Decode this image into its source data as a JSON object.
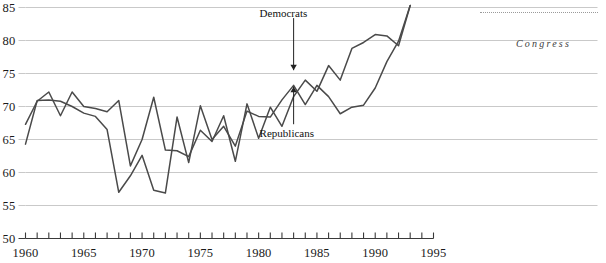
{
  "figure": {
    "margin_note": "Congress",
    "dotted_rule": "decorative-dotted-rule"
  },
  "chart_data": {
    "type": "line",
    "title": "",
    "subtitle": "",
    "xlabel": "",
    "ylabel": "",
    "grid": true,
    "legend_position": "inline-annotations",
    "xlim": [
      1960,
      1995
    ],
    "ylim": [
      50,
      85
    ],
    "y_ticks": [
      50,
      55,
      60,
      65,
      70,
      75,
      80,
      85
    ],
    "y_tick_labels": [
      "50",
      "55",
      "60",
      "65",
      "70",
      "75",
      "80",
      "85"
    ],
    "x_ticks": [
      1960,
      1961,
      1962,
      1963,
      1964,
      1965,
      1966,
      1967,
      1968,
      1969,
      1970,
      1971,
      1972,
      1973,
      1974,
      1975,
      1976,
      1977,
      1978,
      1979,
      1980,
      1981,
      1982,
      1983,
      1984,
      1985,
      1986,
      1987,
      1988,
      1989,
      1990,
      1991,
      1992,
      1993,
      1994,
      1995
    ],
    "x_tick_labels_shown": [
      "1960",
      "1965",
      "1970",
      "1975",
      "1980",
      "1985",
      "1990",
      "1995"
    ],
    "x_labeled_ticks": [
      1960,
      1965,
      1970,
      1975,
      1980,
      1985,
      1990,
      1995
    ],
    "annotations": [
      {
        "text": "Democrats",
        "series": "Democrats",
        "arrow": "down",
        "x": 1983,
        "y": 75.5,
        "label_x": 1983,
        "label_y": 84.0
      },
      {
        "text": "Republicans",
        "series": "Republicans",
        "arrow": "up",
        "x": 1983,
        "y": 73.0,
        "label_x": 1983,
        "label_y": 65.8
      }
    ],
    "series": [
      {
        "name": "Democrats",
        "color": "#4a4a4a",
        "x": [
          1960,
          1961,
          1962,
          1963,
          1964,
          1965,
          1966,
          1967,
          1968,
          1969,
          1970,
          1971,
          1972,
          1973,
          1974,
          1975,
          1976,
          1977,
          1978,
          1979,
          1980,
          1981,
          1982,
          1983,
          1984,
          1985,
          1986,
          1987,
          1988,
          1989,
          1990,
          1991,
          1992,
          1993
        ],
        "values": [
          67.3,
          70.8,
          72.2,
          68.6,
          72.2,
          70.0,
          69.7,
          69.2,
          70.9,
          61.0,
          65.0,
          71.4,
          63.4,
          63.3,
          62.4,
          66.4,
          64.7,
          68.6,
          61.7,
          70.4,
          65.2,
          69.9,
          67.0,
          71.5,
          74.0,
          72.3,
          76.2,
          74.0,
          78.8,
          79.7,
          80.9,
          80.7,
          79.2,
          85.3
        ]
      },
      {
        "name": "Republicans",
        "color": "#4a4a4a",
        "x": [
          1960,
          1961,
          1962,
          1963,
          1964,
          1965,
          1966,
          1967,
          1968,
          1969,
          1970,
          1971,
          1972,
          1973,
          1974,
          1975,
          1976,
          1977,
          1978,
          1979,
          1980,
          1981,
          1982,
          1983,
          1984,
          1985,
          1986,
          1987,
          1988,
          1989,
          1990,
          1991,
          1992,
          1993
        ],
        "values": [
          64.3,
          70.9,
          71.0,
          70.8,
          70.0,
          69.0,
          68.5,
          66.5,
          57.0,
          59.5,
          62.6,
          57.3,
          56.9,
          68.4,
          61.5,
          70.1,
          65.0,
          67.0,
          64.0,
          69.3,
          68.5,
          68.4,
          71.0,
          73.2,
          70.3,
          73.2,
          71.5,
          68.9,
          69.9,
          70.2,
          72.8,
          76.8,
          79.9,
          85.3
        ]
      }
    ]
  }
}
